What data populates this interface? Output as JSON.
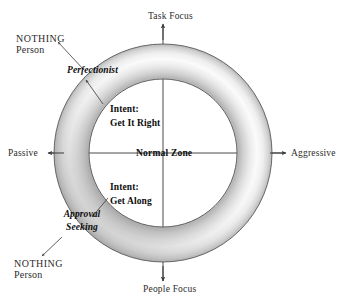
{
  "diagram": {
    "axes": {
      "top_label": "Task Focus",
      "bottom_label": "People Focus",
      "left_label": "Passive",
      "right_label": "Aggressive"
    },
    "center": {
      "zone_label": "Normal Zone"
    },
    "intents": {
      "upper_line1": "Intent:",
      "upper_line2": "Get It Right",
      "lower_line1": "Intent:",
      "lower_line2": "Get Along"
    },
    "styles": {
      "upper_style": "Perfectionist",
      "lower_style_line1": "Approval",
      "lower_style_line2": "Seeking"
    },
    "callouts": {
      "upper_nothing": "NOTHING",
      "upper_person": "Person",
      "lower_nothing": "NOTHING",
      "lower_person": "Person"
    },
    "colors": {
      "ring_outline": "#555555",
      "ring_light": "#fdfdfd",
      "ring_shadow": "#b9b9b9",
      "ring_deep_shadow": "#9a9a9a",
      "text": "#1a1a1a",
      "axis_line": "#4a4a4a",
      "background": "#ffffff"
    },
    "geometry": {
      "center_x": 163,
      "center_y": 153,
      "outer_radius": 109,
      "inner_radius": 74
    }
  }
}
